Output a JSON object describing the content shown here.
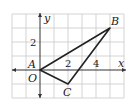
{
  "diagram": {
    "type": "coordinate-plane-triangle",
    "axes": {
      "x_label": "x",
      "y_label": "y",
      "x_ticks_labeled": [
        "2",
        "4"
      ],
      "y_ticks_labeled": [
        "2"
      ]
    },
    "grid": {
      "x_range": [
        -2,
        6
      ],
      "y_range": [
        -2,
        4
      ],
      "step": 1
    },
    "points": [
      {
        "name": "A",
        "x": 0,
        "y": 0
      },
      {
        "name": "B",
        "x": 5,
        "y": 3
      },
      {
        "name": "C",
        "x": 2,
        "y": -1
      }
    ],
    "origin_label": "O",
    "colors": {
      "grid": "#c8c8c8",
      "lines": "#222222"
    }
  }
}
